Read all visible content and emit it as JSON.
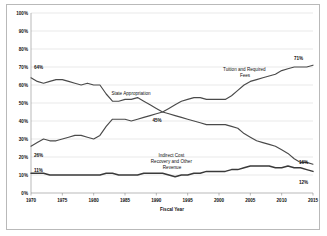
{
  "chart_data": {
    "type": "line",
    "title": "",
    "xlabel": "Fiscal Year",
    "ylabel": "",
    "xlim": [
      1970,
      2015
    ],
    "ylim": [
      0,
      100
    ],
    "grid": true,
    "legend_position": "inline-annotations",
    "xticks": [
      "1970",
      "1975",
      "1980",
      "1985",
      "1990",
      "1995",
      "2000",
      "2005",
      "2010",
      "2015"
    ],
    "yticks": [
      "0%",
      "10%",
      "20%",
      "30%",
      "40%",
      "50%",
      "60%",
      "70%",
      "80%",
      "90%",
      "100%"
    ],
    "x": [
      1970,
      1971,
      1972,
      1973,
      1974,
      1975,
      1976,
      1977,
      1978,
      1979,
      1980,
      1981,
      1982,
      1983,
      1984,
      1985,
      1986,
      1987,
      1988,
      1989,
      1990,
      1991,
      1992,
      1993,
      1994,
      1995,
      1996,
      1997,
      1998,
      1999,
      2000,
      2001,
      2002,
      2003,
      2004,
      2005,
      2006,
      2007,
      2008,
      2009,
      2010,
      2011,
      2012,
      2013,
      2014,
      2015
    ],
    "series": [
      {
        "name": "State Appropriation",
        "label_start": "64%",
        "label_end": "16%",
        "values": [
          64,
          62,
          61,
          62,
          63,
          63,
          62,
          61,
          60,
          61,
          60,
          60,
          55,
          51,
          51,
          52,
          52,
          53,
          51,
          49,
          47,
          45,
          44,
          43,
          42,
          41,
          40,
          39,
          38,
          38,
          38,
          38,
          37,
          36,
          33,
          31,
          29,
          28,
          27,
          26,
          24,
          22,
          19,
          17,
          17,
          16
        ]
      },
      {
        "name": "Tuition and Required Fees",
        "label_start": "26%",
        "label_end": "71%",
        "values": [
          26,
          28,
          30,
          29,
          29,
          30,
          31,
          32,
          32,
          31,
          30,
          32,
          37,
          41,
          41,
          41,
          40,
          41,
          42,
          43,
          44,
          45,
          47,
          49,
          51,
          52,
          53,
          53,
          52,
          52,
          52,
          52,
          54,
          57,
          60,
          62,
          63,
          64,
          65,
          66,
          68,
          69,
          70,
          70,
          70,
          71
        ]
      },
      {
        "name": "Indirect Cost Recovery and Other Revenue",
        "label_start": "11%",
        "label_end": "12%",
        "values": [
          11,
          11,
          11,
          10,
          10,
          10,
          10,
          10,
          10,
          10,
          10,
          10,
          11,
          11,
          10,
          10,
          10,
          10,
          11,
          11,
          11,
          11,
          10,
          9,
          10,
          10,
          11,
          11,
          12,
          12,
          12,
          12,
          13,
          13,
          14,
          15,
          15,
          15,
          15,
          14,
          14,
          15,
          14,
          14,
          13,
          12
        ]
      }
    ],
    "annotations": [
      {
        "name": "state-appropriation-annotation",
        "lines": [
          "State Appropriation"
        ]
      },
      {
        "name": "tuition-annotation",
        "lines": [
          "Tuition and Required",
          "Fees"
        ]
      },
      {
        "name": "indirect-cost-annotation",
        "lines": [
          "Indirect Cost",
          "Recovery and Other",
          "Revenue"
        ]
      }
    ],
    "point_labels": [
      {
        "name": "crossover-label",
        "text": "45%",
        "x": 1991,
        "y": 45
      }
    ],
    "colors": {
      "line": "#4a4a4a",
      "grid": "#d2d2d2",
      "axis": "#8a8a8a",
      "text": "#111111",
      "background": "#ffffff"
    }
  }
}
